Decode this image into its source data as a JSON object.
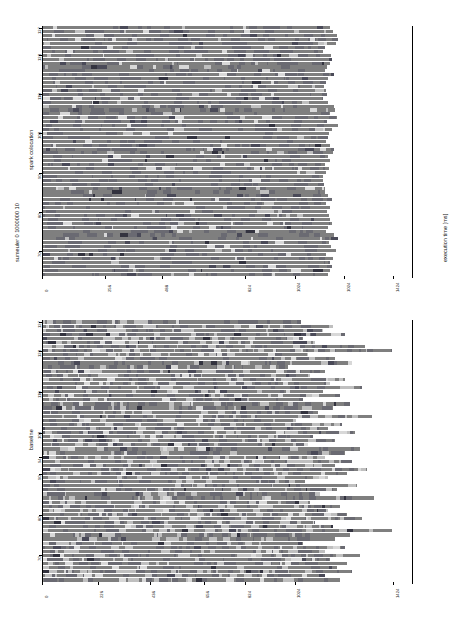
{
  "figure": {
    "title": "sumeuler 0 1000000 10",
    "xlabel": "execution time [ms]",
    "ylabel": ""
  },
  "panels": [
    {
      "name": "spark colocation",
      "label": "spark colocation",
      "x_ticks": [
        "0",
        "256",
        "488",
        "824",
        "1024",
        "1024",
        "1424"
      ],
      "x_tick_values": [
        0,
        256,
        488,
        824,
        1024,
        1224,
        1424
      ],
      "y_ticks": [
        "127",
        "120",
        "110",
        "100",
        "90",
        "80",
        "70"
      ],
      "y_tick_values": [
        127,
        120,
        110,
        100,
        90,
        80,
        70
      ]
    },
    {
      "name": "baseline",
      "label": "baseline",
      "x_ticks": [
        "0",
        "226",
        "436",
        "656",
        "824",
        "1024",
        "1424"
      ],
      "x_tick_values": [
        0,
        226,
        436,
        656,
        824,
        1024,
        1424
      ],
      "y_ticks": [
        "127",
        "120",
        "110",
        "100",
        "94",
        "90",
        "80",
        "70"
      ],
      "y_tick_values": [
        127,
        120,
        110,
        100,
        94,
        90,
        80,
        70
      ]
    }
  ],
  "colors": {
    "bar_main": "#7f7f7f",
    "bar_light": "#bfbfbf",
    "bar_lighter": "#d8d8d8",
    "bar_dark": "#4a4a58",
    "bar_darker": "#33333f",
    "bar_mid": "#6a6a72",
    "axis": "#000000",
    "background": "#ffffff",
    "text": "#111111"
  },
  "chart_data": {
    "type": "bar",
    "orientation": "horizontal",
    "title": "sumeuler 0 1000000 10",
    "xlabel": "execution time [ms]",
    "ylabel": "",
    "grid": false,
    "legend": false,
    "xlim": [
      0,
      1500
    ],
    "panels": [
      {
        "name": "spark colocation",
        "categories": [
          127,
          126,
          125,
          124,
          123,
          122,
          121,
          120,
          119,
          118,
          117,
          116,
          115,
          114,
          113,
          112,
          111,
          110,
          109,
          108,
          107,
          106,
          105,
          104,
          103,
          102,
          101,
          100,
          99,
          98,
          97,
          96,
          95,
          94,
          93,
          92,
          91,
          90,
          89,
          88,
          87,
          86,
          85,
          84,
          83,
          82,
          81,
          80,
          79,
          78,
          77,
          76,
          75,
          74,
          73,
          72,
          71,
          70,
          69,
          68,
          67,
          66,
          65,
          64
        ],
        "values": [
          1168,
          1180,
          1196,
          1200,
          1192,
          1150,
          1140,
          1172,
          1178,
          1170,
          1156,
          1148,
          1184,
          1160,
          1152,
          1146,
          1152,
          1156,
          1140,
          1160,
          1186,
          1190,
          1168,
          1198,
          1158,
          1200,
          1176,
          1166,
          1160,
          1152,
          1170,
          1186,
          1178,
          1160,
          1170,
          1148,
          1164,
          1152,
          1142,
          1140,
          1144,
          1150,
          1148,
          1160,
          1176,
          1154,
          1170,
          1156,
          1164,
          1170,
          1178,
          1162,
          1152,
          1186,
          1200,
          1164,
          1174,
          1192,
          1152,
          1182,
          1168,
          1178,
          1170,
          1160
        ],
        "segments_note": "Each bar is a stack of many small runtime segments; most segments are mid-gray with occasional light and dark bands."
      },
      {
        "name": "baseline",
        "categories": [
          127,
          126,
          125,
          124,
          123,
          122,
          121,
          120,
          119,
          118,
          117,
          116,
          115,
          114,
          113,
          112,
          111,
          110,
          109,
          108,
          107,
          106,
          105,
          104,
          103,
          102,
          101,
          100,
          99,
          98,
          97,
          96,
          95,
          94,
          93,
          92,
          91,
          90,
          89,
          88,
          87,
          86,
          85,
          84,
          83,
          82,
          81,
          80,
          79,
          78,
          77,
          76,
          75,
          74,
          73,
          72,
          71,
          70,
          69,
          68,
          67,
          66,
          65,
          64
        ],
        "values": [
          1050,
          1180,
          1140,
          1230,
          1060,
          1110,
          1310,
          1420,
          1080,
          1190,
          1260,
          1000,
          1150,
          1090,
          1230,
          1170,
          1300,
          1140,
          1210,
          1060,
          1250,
          1180,
          1120,
          1340,
          1030,
          1220,
          1160,
          1270,
          1100,
          1190,
          1080,
          1290,
          1230,
          1150,
          1260,
          1190,
          1320,
          1240,
          1160,
          1070,
          1280,
          1200,
          1130,
          1350,
          1090,
          1210,
          1160,
          1240,
          1300,
          1110,
          1180,
          1420,
          1250,
          1190,
          1060,
          1230,
          1150,
          1290,
          1170,
          1240,
          1200,
          1260,
          1150,
          1210
        ],
        "segments_note": "Each bar is a stack of runtime segments; baseline bars show far more light-gray idle segments and greater height variance than spark colocation."
      }
    ]
  }
}
